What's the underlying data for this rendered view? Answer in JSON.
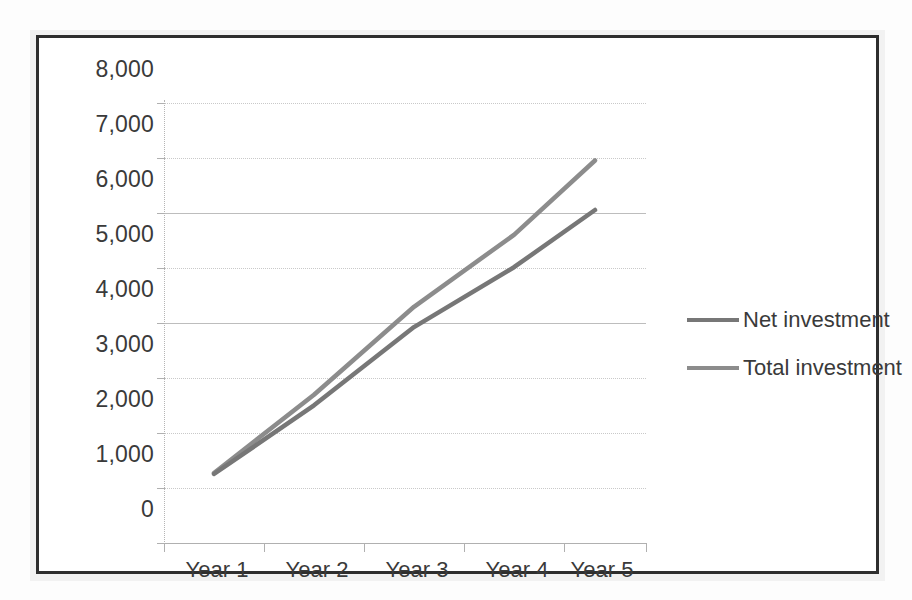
{
  "chart_data": {
    "type": "line",
    "title": "",
    "xlabel": "",
    "ylabel": "",
    "categories": [
      "Year 1",
      "Year 2",
      "Year 3",
      "Year 4",
      "Year 5"
    ],
    "series": [
      {
        "name": "Net investment",
        "color": "#808080",
        "values": [
          1200,
          2450,
          3870,
          4960,
          6000
        ]
      },
      {
        "name": "Total investment",
        "color": "#8c8c8c",
        "values": [
          1220,
          2640,
          4240,
          5550,
          6900
        ]
      }
    ],
    "ylim": [
      0,
      8000
    ],
    "ytick_values": [
      0,
      1000,
      2000,
      3000,
      4000,
      5000,
      6000,
      7000,
      8000
    ],
    "ytick_labels": [
      "0",
      "1,000",
      "2,000",
      "3,000",
      "4,000",
      "5,000",
      "6,000",
      "7,000",
      "8,000"
    ],
    "grid": true,
    "legend_position": "right",
    "plot_background": "#ffffff",
    "gridline_color": "#c9c9c9",
    "axis_color": "#b0b0b0",
    "text_color": "#3a3a3a",
    "frame_color": "#2e2e2e"
  }
}
